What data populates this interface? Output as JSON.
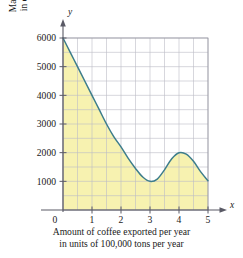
{
  "chart_data": {
    "type": "area",
    "title": "",
    "xlabel": "Amount of coffee exported per year in units of 100,000 tons per year",
    "ylabel": "Marginal revenue in dollars per ton",
    "x_axis_letter": "x",
    "y_axis_letter": "y",
    "xlim": [
      0,
      5
    ],
    "ylim": [
      0,
      6000
    ],
    "x_ticks": [
      "0",
      "1",
      "2",
      "3",
      "4",
      "5"
    ],
    "x_tick_values": [
      0,
      1,
      2,
      3,
      4,
      5
    ],
    "y_ticks": [
      "1000",
      "2000",
      "3000",
      "4000",
      "5000",
      "6000"
    ],
    "y_tick_values": [
      1000,
      2000,
      3000,
      4000,
      5000,
      6000
    ],
    "grid": true,
    "grid_x_step": 0.5,
    "grid_y_step": 500,
    "legend": "none",
    "shaded_region": true,
    "shaded_region_description": "Area under the curve from x=0 to x=5 down to y=0",
    "series": [
      {
        "name": "Marginal revenue",
        "x": [
          0,
          0.25,
          0.5,
          0.75,
          1,
          1.25,
          1.5,
          1.75,
          2,
          2.25,
          2.5,
          2.75,
          3,
          3.25,
          3.5,
          3.75,
          4,
          4.25,
          4.5,
          4.75,
          5
        ],
        "values": [
          6000,
          5500,
          5000,
          4500,
          4000,
          3500,
          3000,
          2560,
          2200,
          1800,
          1450,
          1150,
          1000,
          1080,
          1400,
          1790,
          2000,
          1950,
          1700,
          1330,
          1020
        ]
      }
    ],
    "annotations": {
      "start_point": "(0, 6000)",
      "local_minimum": "(3, 1000)",
      "local_maximum": "(4, 2000)",
      "end_point": "(5, 1000)"
    },
    "colors": {
      "curve": "#3d7d8c",
      "fill": "#f7f2b0",
      "grid": "#b9b9c4",
      "grid_border": "#8f8f9c",
      "axis": "#5a5a66",
      "text": "#1a1a1a"
    }
  }
}
